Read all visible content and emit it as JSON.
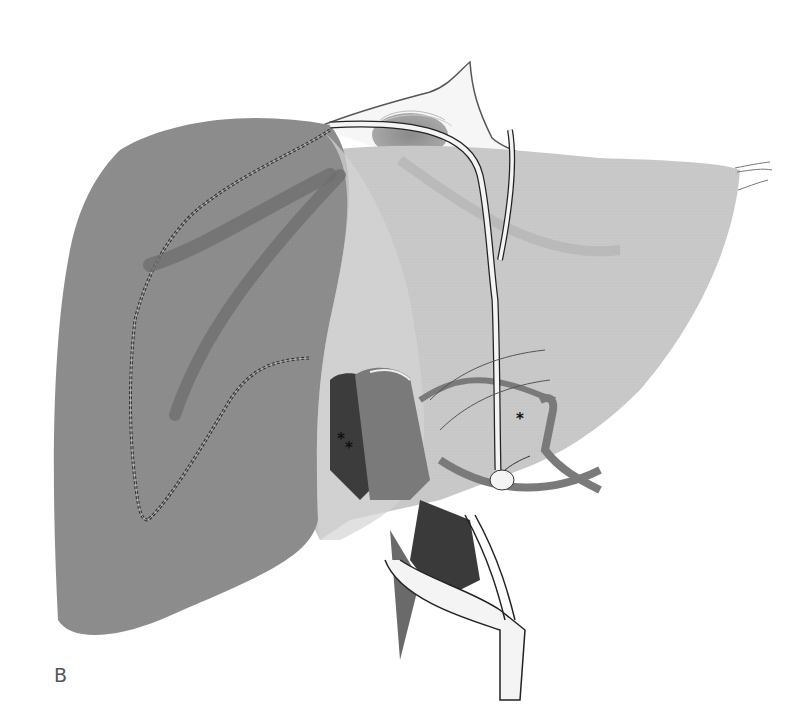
{
  "figure": {
    "panel_label": "B",
    "markers": [
      {
        "id": "single-asterisk",
        "text": "*",
        "x": 516,
        "y": 418
      },
      {
        "id": "double-asterisk-1",
        "text": "*",
        "x": 337,
        "y": 437
      },
      {
        "id": "double-asterisk-2",
        "text": "*",
        "x": 345,
        "y": 446
      }
    ],
    "colors": {
      "right_lobe": "#8c8c8c",
      "left_lobe": "#c8c8c8",
      "vessel_dark": "#6e6e6e",
      "vessel_mid": "#9a9a9a",
      "duct": "#f2f2f2",
      "outline": "#222222",
      "background": "#ffffff"
    }
  }
}
